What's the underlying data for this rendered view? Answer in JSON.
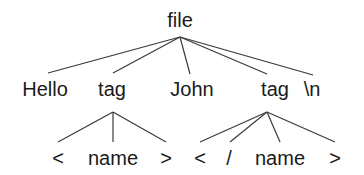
{
  "diagram": {
    "type": "parse-tree",
    "root": {
      "label": "file",
      "x": 180,
      "y": 27,
      "apex": [
        180,
        37
      ]
    },
    "level1": [
      {
        "label": "Hello",
        "x": 45,
        "y": 96,
        "edge_end": [
          48,
          73
        ]
      },
      {
        "label": "tag",
        "x": 112,
        "y": 96,
        "edge_end": [
          113,
          73
        ],
        "apex": [
          113,
          112
        ]
      },
      {
        "label": "John",
        "x": 192,
        "y": 96,
        "edge_end": [
          190,
          74
        ]
      },
      {
        "label": "tag",
        "x": 275,
        "y": 96,
        "edge_end": [
          267,
          74
        ],
        "apex": [
          267,
          112
        ]
      },
      {
        "label": "\\n",
        "x": 312,
        "y": 96,
        "edge_end": [
          313,
          75
        ]
      }
    ],
    "level2_left": [
      {
        "label": "<",
        "x": 58,
        "y": 165,
        "edge_end": [
          58,
          142
        ]
      },
      {
        "label": "name",
        "x": 113,
        "y": 165,
        "edge_end": [
          113,
          142
        ]
      },
      {
        "label": ">",
        "x": 166,
        "y": 165,
        "edge_end": [
          166,
          142
        ]
      }
    ],
    "level2_right": [
      {
        "label": "<",
        "x": 200,
        "y": 165,
        "edge_end": [
          200,
          142
        ]
      },
      {
        "label": "/",
        "x": 229,
        "y": 165,
        "edge_end": [
          230,
          142
        ]
      },
      {
        "label": "name",
        "x": 280,
        "y": 165,
        "edge_end": [
          280,
          142
        ]
      },
      {
        "label": ">",
        "x": 335,
        "y": 165,
        "edge_end": [
          335,
          142
        ]
      }
    ]
  }
}
